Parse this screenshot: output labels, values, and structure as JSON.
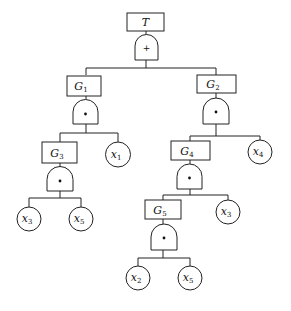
{
  "diagram": {
    "type": "fault-tree",
    "top_event": {
      "label": "T",
      "gate": "OR",
      "gate_symbol": "+"
    },
    "events": [
      {
        "id": "T",
        "base": "T",
        "sub": "",
        "gate_symbol": "+",
        "children": [
          "G1",
          "G2"
        ]
      },
      {
        "id": "G1",
        "base": "G",
        "sub": "1",
        "gate_symbol": "•",
        "children": [
          "G3",
          "x1"
        ]
      },
      {
        "id": "G2",
        "base": "G",
        "sub": "2",
        "gate_symbol": "•",
        "children": [
          "G4",
          "x4"
        ]
      },
      {
        "id": "G3",
        "base": "G",
        "sub": "3",
        "gate_symbol": "•",
        "children": [
          "x3",
          "x5"
        ]
      },
      {
        "id": "G4",
        "base": "G",
        "sub": "4",
        "gate_symbol": "•",
        "children": [
          "G5",
          "x3"
        ]
      },
      {
        "id": "G5",
        "base": "G",
        "sub": "5",
        "gate_symbol": "•",
        "children": [
          "x2",
          "x5"
        ]
      }
    ],
    "labels": {
      "T": "T",
      "G": "G",
      "x": "x",
      "sub1": "1",
      "sub2": "2",
      "sub3": "3",
      "sub4": "4",
      "sub5": "5",
      "or_symbol": "+",
      "and_symbol": "•"
    },
    "basic_events": [
      {
        "parent": "G1",
        "base": "x",
        "sub": "1"
      },
      {
        "parent": "G2",
        "base": "x",
        "sub": "4"
      },
      {
        "parent": "G3",
        "base": "x",
        "sub": "3"
      },
      {
        "parent": "G3",
        "base": "x",
        "sub": "5"
      },
      {
        "parent": "G4",
        "base": "x",
        "sub": "3"
      },
      {
        "parent": "G5",
        "base": "x",
        "sub": "2"
      },
      {
        "parent": "G5",
        "base": "x",
        "sub": "5"
      }
    ]
  }
}
